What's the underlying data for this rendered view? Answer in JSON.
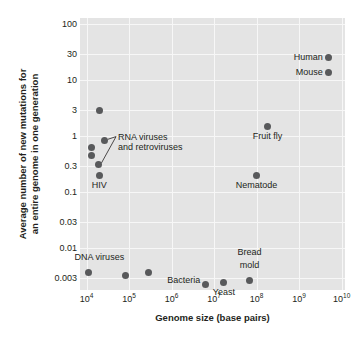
{
  "chart_data": {
    "type": "scatter",
    "title": "",
    "xlabel": "Genome size (base pairs)",
    "ylabel_line1": "Average number of new mutations for",
    "ylabel_line2": "an entire genome in one generation",
    "xscale": "log",
    "yscale": "log",
    "xlim": [
      7000,
      12000000000
    ],
    "ylim": [
      0.0018,
      130
    ],
    "grid": true,
    "legend": "none",
    "xticks": [
      {
        "label": "10",
        "exp": "4",
        "value": 10000
      },
      {
        "label": "10",
        "exp": "5",
        "value": 100000
      },
      {
        "label": "10",
        "exp": "6",
        "value": 1000000
      },
      {
        "label": "10",
        "exp": "7",
        "value": 10000000
      },
      {
        "label": "10",
        "exp": "8",
        "value": 100000000
      },
      {
        "label": "10",
        "exp": "9",
        "value": 1000000000
      },
      {
        "label": "10",
        "exp": "10",
        "value": 10000000000
      }
    ],
    "yticks": [
      {
        "label": "100",
        "value": 100
      },
      {
        "label": "30",
        "value": 30
      },
      {
        "label": "10",
        "value": 10
      },
      {
        "label": "3",
        "value": 3
      },
      {
        "label": "1",
        "value": 1
      },
      {
        "label": "0.3",
        "value": 0.3
      },
      {
        "label": "0.1",
        "value": 0.1
      },
      {
        "label": "0.03",
        "value": 0.03
      },
      {
        "label": "0.01",
        "value": 0.01
      },
      {
        "label": "0.003",
        "value": 0.003
      }
    ],
    "point_color": "#58595b",
    "plot_background": "#e4e4e4",
    "gridline_color": "#f7f7f7",
    "points": [
      {
        "name": "rna-virus-1",
        "x": 20000,
        "y": 2.9,
        "label": "",
        "label_pos": "none"
      },
      {
        "name": "rna-virus-2",
        "x": 27000,
        "y": 0.85,
        "label": "",
        "label_pos": "none"
      },
      {
        "name": "rna-virus-3",
        "x": 13000,
        "y": 0.62,
        "label": "",
        "label_pos": "none"
      },
      {
        "name": "rna-virus-4",
        "x": 13000,
        "y": 0.46,
        "label": "",
        "label_pos": "none"
      },
      {
        "name": "rna-virus-5",
        "x": 19000,
        "y": 0.32,
        "label": "",
        "label_pos": "none"
      },
      {
        "name": "hiv",
        "x": 20000,
        "y": 0.2,
        "label": "HIV",
        "label_pos": "below"
      },
      {
        "name": "dna-virus-1",
        "x": 11000,
        "y": 0.0037,
        "label": "",
        "label_pos": "none"
      },
      {
        "name": "dna-virus-2",
        "x": 82000,
        "y": 0.0033,
        "label": "",
        "label_pos": "none"
      },
      {
        "name": "dna-virus-3",
        "x": 290000,
        "y": 0.0037,
        "label": "",
        "label_pos": "none"
      },
      {
        "name": "bacteria",
        "x": 6200000,
        "y": 0.0023,
        "label": "Bacteria",
        "label_pos": "left-mid"
      },
      {
        "name": "yeast",
        "x": 17000000,
        "y": 0.0025,
        "label": "Yeast",
        "label_pos": "below"
      },
      {
        "name": "bread-mold",
        "x": 68000000,
        "y": 0.0027,
        "label": "",
        "label_pos": "none"
      },
      {
        "name": "nematode",
        "x": 100000000,
        "y": 0.2,
        "label": "Nematode",
        "label_pos": "below"
      },
      {
        "name": "fruit-fly",
        "x": 180000000,
        "y": 1.5,
        "label": "Fruit fly",
        "label_pos": "below"
      },
      {
        "name": "mouse",
        "x": 5000000000,
        "y": 14,
        "label": "Mouse",
        "label_pos": "left"
      },
      {
        "name": "human",
        "x": 5000000000,
        "y": 26,
        "label": "Human",
        "label_pos": "left"
      }
    ],
    "extra_labels": [
      {
        "name": "dna-viruses-label",
        "text": "DNA viruses",
        "x": 20000,
        "y": 0.0085
      },
      {
        "name": "bread-mold-label-line1",
        "text": "Bread",
        "x": 68000000,
        "y": 0.0105
      },
      {
        "name": "bread-mold-label-line2",
        "text": "mold",
        "x": 68000000,
        "y": 0.0062
      }
    ],
    "annotation": {
      "name": "rna-viruses-annotation",
      "line1": "RNA viruses",
      "line2": "and retroviruses",
      "anchor_x": 55000,
      "anchor_y": 0.95,
      "targets": [
        {
          "x": 27000,
          "y": 0.85
        },
        {
          "x": 19000,
          "y": 0.32
        }
      ]
    }
  }
}
